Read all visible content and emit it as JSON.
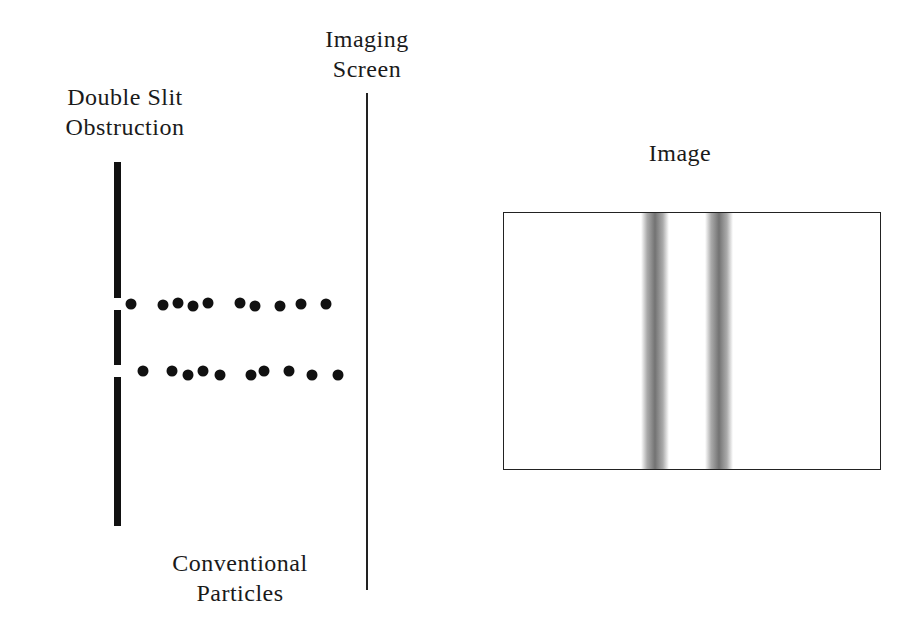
{
  "labels": {
    "obstruction": [
      "Double Slit",
      "Obstruction"
    ],
    "screen": [
      "Imaging",
      "Screen"
    ],
    "image": "Image",
    "particles": [
      "Conventional",
      "Particles"
    ]
  },
  "obstruction": {
    "x": 114,
    "width": 7,
    "segments": [
      {
        "top": 162,
        "bottom": 298
      },
      {
        "top": 310,
        "bottom": 365
      },
      {
        "top": 377,
        "bottom": 526
      }
    ],
    "slits": [
      {
        "top": 298,
        "bottom": 310
      },
      {
        "top": 365,
        "bottom": 377
      }
    ]
  },
  "particles": {
    "row1": [
      [
        131,
        304
      ],
      [
        163,
        305
      ],
      [
        178,
        303
      ],
      [
        193,
        306
      ],
      [
        208,
        303
      ],
      [
        240,
        303
      ],
      [
        255,
        306
      ],
      [
        280,
        306
      ],
      [
        301,
        304
      ],
      [
        326,
        304
      ]
    ],
    "row2": [
      [
        143,
        371
      ],
      [
        172,
        371
      ],
      [
        188,
        375
      ],
      [
        203,
        371
      ],
      [
        220,
        375
      ],
      [
        251,
        375
      ],
      [
        264,
        371
      ],
      [
        289,
        371
      ],
      [
        312,
        375
      ],
      [
        338,
        375
      ]
    ]
  },
  "image_panel": {
    "bands_left_px": [
      137,
      201
    ],
    "band_color": "#5a5a5a"
  }
}
